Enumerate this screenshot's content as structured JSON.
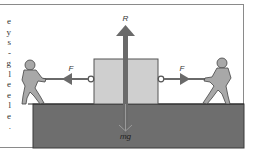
{
  "figure": {
    "side_text_fragments": [
      "e",
      "y",
      "s",
      "-",
      "g",
      "l",
      "e",
      "e",
      "l",
      "e",
      "."
    ],
    "labels": {
      "reaction": "R",
      "weight": "mg",
      "force_left": "F",
      "force_right": "F"
    },
    "colors": {
      "ground": "#6e6e6e",
      "box": "#cfcfcf",
      "arrow": "#6a6a6a",
      "figure": "#a8a8a8",
      "frame": "#8a8a8a"
    }
  }
}
